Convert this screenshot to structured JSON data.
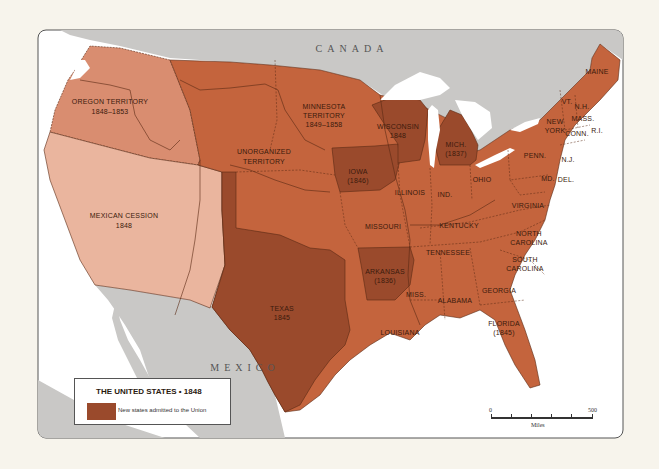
{
  "map": {
    "title": "THE UNITED STATES • 1848",
    "colors": {
      "background": "#f7f4ec",
      "frame": "#555555",
      "water": "#ffffff",
      "foreign_land": "#c9c8c6",
      "oregon_territory": "#d98d70",
      "mexican_cession": "#eab59e",
      "states": "#c4643d",
      "new_states": "#9a4a2c",
      "borders": "#5a2a14"
    },
    "countries": [
      {
        "name": "CANADA"
      },
      {
        "name": "MEXICO"
      }
    ],
    "regions": [
      {
        "id": "oregon",
        "label": "OREGON TERRITORY",
        "sublabel": "1848–1853",
        "category": "territory-light"
      },
      {
        "id": "mexican-cession",
        "label": "MEXICAN CESSION",
        "sublabel": "1848",
        "category": "cession"
      },
      {
        "id": "unorganized",
        "label": "UNORGANIZED",
        "sublabel": "TERRITORY",
        "category": "state"
      },
      {
        "id": "minnesota",
        "label": "MINNESOTA",
        "sublabel": "TERRITORY",
        "sublabel2": "1849–1858",
        "category": "state"
      },
      {
        "id": "wisconsin",
        "label": "WISCONSIN",
        "sublabel": "1848",
        "category": "new-state"
      },
      {
        "id": "michigan",
        "label": "MICH.",
        "sublabel": "(1837)",
        "category": "new-state"
      },
      {
        "id": "iowa",
        "label": "IOWA",
        "sublabel": "(1846)",
        "category": "new-state"
      },
      {
        "id": "texas",
        "label": "TEXAS",
        "sublabel": "1845",
        "category": "new-state"
      },
      {
        "id": "arkansas",
        "label": "ARKANSAS",
        "sublabel": "(1836)",
        "category": "new-state"
      },
      {
        "id": "florida",
        "label": "FLORIDA",
        "sublabel": "(1845)",
        "category": "state"
      },
      {
        "id": "illinois",
        "label": "ILLINOIS",
        "category": "state"
      },
      {
        "id": "indiana",
        "label": "IND.",
        "category": "state"
      },
      {
        "id": "ohio",
        "label": "OHIO",
        "category": "state"
      },
      {
        "id": "missouri",
        "label": "MISSOURI",
        "category": "state"
      },
      {
        "id": "kentucky",
        "label": "KENTUCKY",
        "category": "state"
      },
      {
        "id": "tennessee",
        "label": "TENNESSEE",
        "category": "state"
      },
      {
        "id": "virginia",
        "label": "VIRGINIA",
        "category": "state"
      },
      {
        "id": "north-carolina",
        "label": "NORTH",
        "sublabel": "CAROLINA",
        "category": "state"
      },
      {
        "id": "south-carolina",
        "label": "SOUTH",
        "sublabel": "CAROLINA",
        "category": "state"
      },
      {
        "id": "georgia",
        "label": "GEORGIA",
        "category": "state"
      },
      {
        "id": "alabama",
        "label": "ALABAMA",
        "category": "state"
      },
      {
        "id": "mississippi",
        "label": "MISS.",
        "category": "state"
      },
      {
        "id": "louisiana",
        "label": "LOUISIANA",
        "category": "state"
      },
      {
        "id": "pennsylvania",
        "label": "PENN.",
        "category": "state"
      },
      {
        "id": "new-york",
        "label": "NEW",
        "sublabel": "YORK",
        "category": "state"
      },
      {
        "id": "maine",
        "label": "MAINE",
        "category": "state"
      },
      {
        "id": "vermont",
        "label": "VT.",
        "category": "state"
      },
      {
        "id": "new-hampshire",
        "label": "N.H.",
        "category": "state"
      },
      {
        "id": "massachusetts",
        "label": "MASS.",
        "category": "state"
      },
      {
        "id": "connecticut",
        "label": "CONN.",
        "category": "state"
      },
      {
        "id": "rhode-island",
        "label": "R.I.",
        "category": "state"
      },
      {
        "id": "new-jersey",
        "label": "N.J.",
        "category": "state"
      },
      {
        "id": "maryland",
        "label": "MD.",
        "category": "state"
      },
      {
        "id": "delaware",
        "label": "DEL.",
        "category": "state"
      }
    ]
  },
  "legend": {
    "title": "THE UNITED STATES • 1848",
    "items": [
      {
        "label": "New states admitted to the Union",
        "color": "#9a4a2c"
      }
    ]
  },
  "scale": {
    "min_label": "0",
    "max_label": "500",
    "unit": "Miles"
  }
}
